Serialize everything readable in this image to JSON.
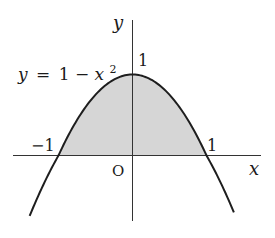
{
  "figure": {
    "equation_label": {
      "y": "y",
      "eq": "=",
      "one": "1",
      "minus": "−",
      "x": "x",
      "exp": "2"
    },
    "axis_labels": {
      "x": "x",
      "y": "y",
      "origin": "O"
    },
    "tick_labels": {
      "x_neg": "−1",
      "x_pos": "1",
      "y_pos": "1"
    },
    "colors": {
      "curve": "#1e1e1e",
      "axis": "#333333",
      "fill": "#d6d6d6"
    }
  },
  "chart_data": {
    "type": "line",
    "title": "",
    "function": "y = 1 - x^2",
    "xlabel": "x",
    "ylabel": "y",
    "x_roots": [
      -1,
      1
    ],
    "vertex": [
      0,
      1
    ],
    "shaded_region": "area between y = 1 - x^2 and the x-axis for -1 <= x <= 1",
    "x_range": [
      -1.39,
      1.37
    ],
    "x": [
      -1.39,
      -1,
      -0.5,
      0,
      0.5,
      1,
      1.37
    ],
    "y": [
      -0.93,
      0,
      0.75,
      1,
      0.75,
      0,
      -0.88
    ],
    "tick_labels": [
      "-1",
      "1",
      "O",
      "1"
    ],
    "grid": false,
    "legend": null
  }
}
